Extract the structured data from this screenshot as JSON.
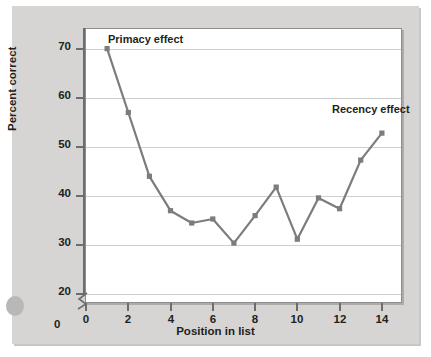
{
  "chart_data": {
    "type": "line",
    "title": "",
    "xlabel": "Position in list",
    "ylabel": "Percent correct",
    "xlim": [
      0,
      15
    ],
    "ylim": [
      18,
      74
    ],
    "grid": true,
    "legend": "none",
    "line_color": "#7d7c7a",
    "marker": "square",
    "x": [
      1,
      2,
      3,
      4,
      5,
      6,
      7,
      8,
      9,
      10,
      11,
      12,
      13,
      14
    ],
    "xticks": [
      "0",
      "2",
      "4",
      "6",
      "8",
      "10",
      "12",
      "14"
    ],
    "xtick_values": [
      0,
      2,
      4,
      6,
      8,
      10,
      12,
      14
    ],
    "yticks": [
      "20",
      "30",
      "40",
      "50",
      "60",
      "70"
    ],
    "ytick_values": [
      20,
      30,
      40,
      50,
      60,
      70
    ],
    "y_origin_label": "0",
    "axis_break": true,
    "series": [
      {
        "name": "Percent correct",
        "values": [
          70.0,
          57.0,
          44.0,
          37.0,
          34.5,
          35.3,
          30.4,
          36.0,
          41.8,
          31.2,
          39.6,
          37.4,
          47.3,
          52.8
        ]
      }
    ],
    "annotations": [
      {
        "text": "Primacy effect",
        "x": 1,
        "y": 73
      },
      {
        "text": "Recency effect",
        "x": 12.6,
        "y": 56
      }
    ]
  },
  "axes": {
    "y_title": "Percent correct",
    "x_title": "Position in list",
    "zero_label": "0"
  },
  "labels": {
    "primacy": "Primacy effect",
    "recency": "Recency effect"
  }
}
